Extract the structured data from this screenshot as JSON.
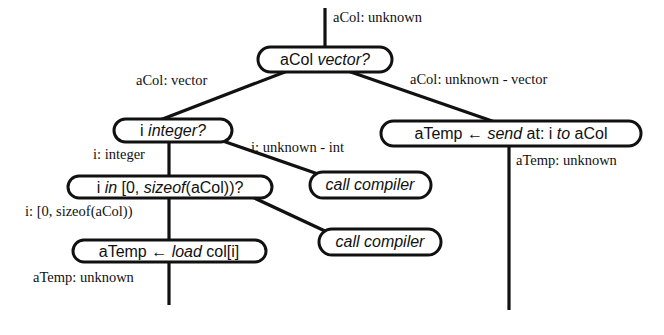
{
  "diagram": {
    "type": "type-inference decision tree",
    "nodes": {
      "vector_test": {
        "parts": [
          {
            "text": "aCol ",
            "italic": false
          },
          {
            "text": "vector?",
            "italic": true
          }
        ]
      },
      "integer_test": {
        "parts": [
          {
            "text": "i ",
            "italic": false
          },
          {
            "text": "integer?",
            "italic": true
          }
        ]
      },
      "range_test": {
        "parts": [
          {
            "text": "i ",
            "italic": false
          },
          {
            "text": "in",
            "italic": true
          },
          {
            "text": " [0, ",
            "italic": false
          },
          {
            "text": "sizeof",
            "italic": true
          },
          {
            "text": "(aCol))?",
            "italic": false
          }
        ]
      },
      "load_op": {
        "parts": [
          {
            "text": "aTemp ← ",
            "italic": false
          },
          {
            "text": "load",
            "italic": true
          },
          {
            "text": " col[i]",
            "italic": false
          }
        ]
      },
      "send_op": {
        "parts": [
          {
            "text": "aTemp ← ",
            "italic": false
          },
          {
            "text": "send",
            "italic": true
          },
          {
            "text": " at: i ",
            "italic": false
          },
          {
            "text": "to",
            "italic": true
          },
          {
            "text": " aCol",
            "italic": false
          }
        ]
      },
      "call_compiler_1": {
        "parts": [
          {
            "text": "call compiler",
            "italic": true
          }
        ]
      },
      "call_compiler_2": {
        "parts": [
          {
            "text": "call compiler",
            "italic": true
          }
        ]
      }
    },
    "labels": {
      "entry": "aCol: unknown",
      "vector_true": "aCol: vector",
      "vector_false": "aCol: unknown - vector",
      "integer_true": "i: integer",
      "integer_false": "i: unknown - int",
      "range_true": "i: [0, sizeof(aCol))",
      "load_result": "aTemp: unknown",
      "send_result": "aTemp: unknown"
    }
  }
}
